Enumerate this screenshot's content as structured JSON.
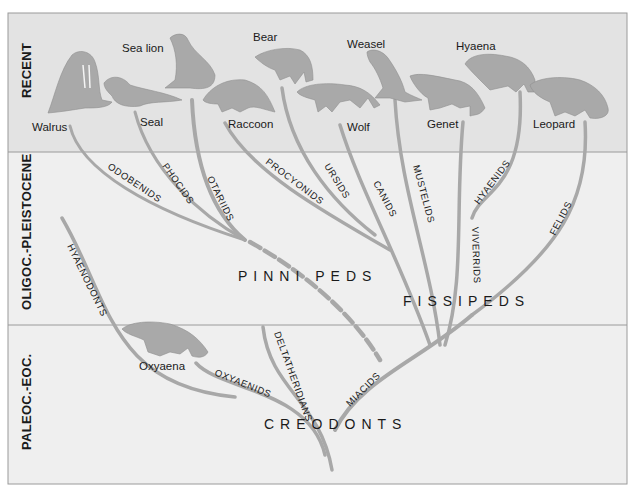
{
  "figure": {
    "periods": [
      {
        "label": "RECENT"
      },
      {
        "label": "OLIGOC.-PLEISTOCENE"
      },
      {
        "label": "PALEOC.-EOC."
      }
    ],
    "animals": [
      {
        "label": "Walrus"
      },
      {
        "label": "Sea lion"
      },
      {
        "label": "Seal"
      },
      {
        "label": "Bear"
      },
      {
        "label": "Raccoon"
      },
      {
        "label": "Weasel"
      },
      {
        "label": "Wolf"
      },
      {
        "label": "Hyaena"
      },
      {
        "label": "Genet"
      },
      {
        "label": "Leopard"
      },
      {
        "label": "Oxyaena"
      }
    ],
    "branches": [
      {
        "label": "ODOBENIDS"
      },
      {
        "label": "PHOCIDS"
      },
      {
        "label": "OTARIIDS"
      },
      {
        "label": "PROCYONIDS"
      },
      {
        "label": "URSIDS"
      },
      {
        "label": "CANIDS"
      },
      {
        "label": "MUSTELIDS"
      },
      {
        "label": "HYAENIDS"
      },
      {
        "label": "VIVERRIDS"
      },
      {
        "label": "FELIDS"
      },
      {
        "label": "HYAENODONTS"
      },
      {
        "label": "OXYAENIDS"
      },
      {
        "label": "DELTATHERIDIANS"
      },
      {
        "label": "MIACIDS"
      }
    ],
    "groups": [
      {
        "label": "PINNI PEDS"
      },
      {
        "label": "FISSIPEDS"
      },
      {
        "label": "CREODONTS"
      }
    ],
    "colors": {
      "band_recent": "#e3e3e3",
      "band_lower": "#efefef",
      "branch": "#a8a8a8",
      "animal": "#a9a9a9",
      "frame": "#9a9a9a"
    }
  }
}
